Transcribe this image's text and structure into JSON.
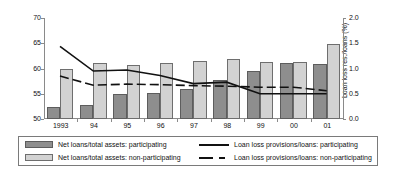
{
  "chart_data": {
    "type": "bar",
    "title": "",
    "xlabel": "",
    "ylabel": "Net loans/total assets (%)",
    "ylabel_right": "Loan loss res./loans (%)",
    "categories": [
      "1993",
      "94",
      "95",
      "96",
      "97",
      "98",
      "99",
      "00",
      "01"
    ],
    "ylim": [
      50,
      70
    ],
    "yticks": [
      "50",
      "55",
      "60",
      "65",
      "70"
    ],
    "ytick_values": [
      50,
      55,
      60,
      65,
      70
    ],
    "ylim_right": [
      0.0,
      2.0
    ],
    "yticks_right": [
      "0.0",
      "0.5",
      "1.0",
      "1.5",
      "2.0"
    ],
    "ytick_values_right": [
      0.0,
      0.5,
      1.0,
      1.5,
      2.0
    ],
    "grid": false,
    "legend_position": "below",
    "series": [
      {
        "name": "Net loans/total assets: participating",
        "kind": "bar",
        "axis": "left",
        "color": "#8e8e8e",
        "values": [
          52.4,
          52.8,
          54.9,
          55.2,
          56.0,
          57.8,
          59.6,
          61.0,
          60.9
        ]
      },
      {
        "name": "Net loans/total assets: non-participating",
        "kind": "bar",
        "axis": "left",
        "color": "#d2d2d2",
        "values": [
          59.9,
          61.0,
          60.6,
          61.1,
          61.4,
          61.8,
          61.3,
          61.2,
          64.9
        ]
      },
      {
        "name": "Loan loss provisions/loans: participating",
        "kind": "line",
        "style": "solid",
        "axis": "right",
        "color": "#111111",
        "values": [
          1.44,
          0.95,
          0.97,
          0.86,
          0.7,
          0.73,
          0.5,
          0.5,
          0.5
        ]
      },
      {
        "name": "Loan loss provisions/loans: non-participating",
        "kind": "line",
        "style": "dashed",
        "axis": "right",
        "color": "#111111",
        "values": [
          0.85,
          0.67,
          0.69,
          0.68,
          0.66,
          0.65,
          0.63,
          0.63,
          0.56
        ]
      }
    ]
  },
  "legend": {
    "items": [
      {
        "label": "Net loans/total assets: participating",
        "swatch": "participating-bar-swatch"
      },
      {
        "label": "Net loans/total assets: non-participating",
        "swatch": "nonparticipating-bar-swatch"
      },
      {
        "label": "Loan loss provisions/loans: participating",
        "swatch": "solid-line-swatch"
      },
      {
        "label": "Loan loss provisions/loans: non-participating",
        "swatch": "dashed-line-swatch"
      }
    ]
  }
}
